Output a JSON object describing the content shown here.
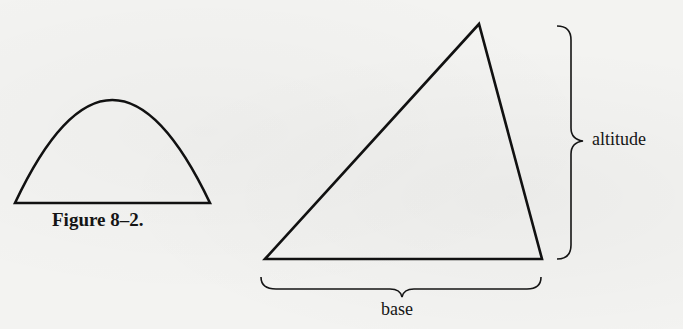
{
  "figure": {
    "caption": "Figure 8–2.",
    "arch": {
      "shape": "parabolic-arch",
      "base_left": [
        15,
        203
      ],
      "peak": [
        112,
        100
      ],
      "base_right": [
        210,
        203
      ]
    },
    "triangle": {
      "vertices": [
        [
          265,
          259
        ],
        [
          479,
          24
        ],
        [
          542,
          259
        ]
      ],
      "labels": {
        "altitude": "altitude",
        "base": "base"
      }
    }
  },
  "colors": {
    "paper": "#f3f3f1",
    "ink": "#111111"
  }
}
